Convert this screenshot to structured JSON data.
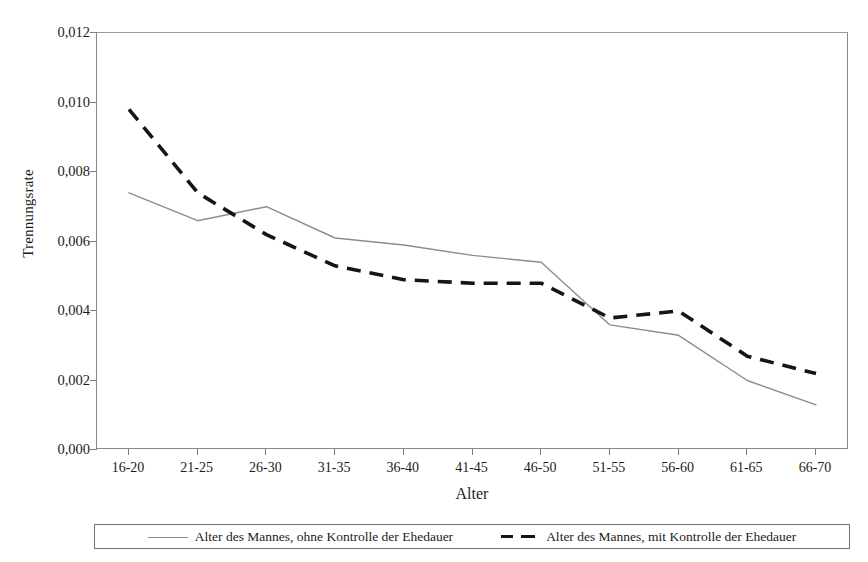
{
  "chart_data": {
    "type": "line",
    "title": "",
    "xlabel": "Alter",
    "ylabel": "Trennungsrate",
    "categories": [
      "16-20",
      "21-25",
      "26-30",
      "31-35",
      "36-40",
      "41-45",
      "46-50",
      "51-55",
      "56-60",
      "61-65",
      "66-70"
    ],
    "ylim": [
      0,
      0.012
    ],
    "yticks": [
      "0,000",
      "0,002",
      "0,004",
      "0,006",
      "0,008",
      "0,010",
      "0,012"
    ],
    "ytick_values": [
      0,
      0.002,
      0.004,
      0.006,
      0.008,
      0.01,
      0.012
    ],
    "grid": false,
    "legend_position": "bottom",
    "series": [
      {
        "name": "Alter des Mannes, ohne Kontrolle der Ehedauer",
        "style": "solid",
        "color": "#8c8c8c",
        "values": [
          0.0074,
          0.0066,
          0.007,
          0.0061,
          0.0059,
          0.0056,
          0.0054,
          0.0036,
          0.0033,
          0.002,
          0.0013
        ]
      },
      {
        "name": "Alter des Mannes, mit Kontrolle der Ehedauer",
        "style": "dashed",
        "color": "#151515",
        "values": [
          0.0098,
          0.0074,
          0.0062,
          0.0053,
          0.0049,
          0.0048,
          0.0048,
          0.0038,
          0.004,
          0.0027,
          0.0022
        ]
      }
    ]
  },
  "colors": {
    "series_solid": "#8c8c8c",
    "series_dashed": "#151515",
    "axis": "#8a8a8a",
    "text": "#1c1c1c",
    "background": "#ffffff"
  }
}
